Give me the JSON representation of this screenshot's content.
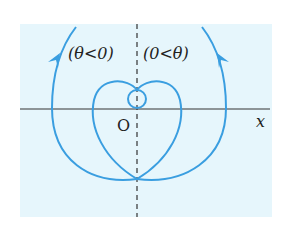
{
  "diagram": {
    "background_color": "#e6f6fc",
    "curve_color": "#3a9ee0",
    "axis_color": "#333333",
    "labels": {
      "left_region": "(θ<0)",
      "right_region": "(0<θ)",
      "origin": "O",
      "x_axis": "x"
    }
  }
}
